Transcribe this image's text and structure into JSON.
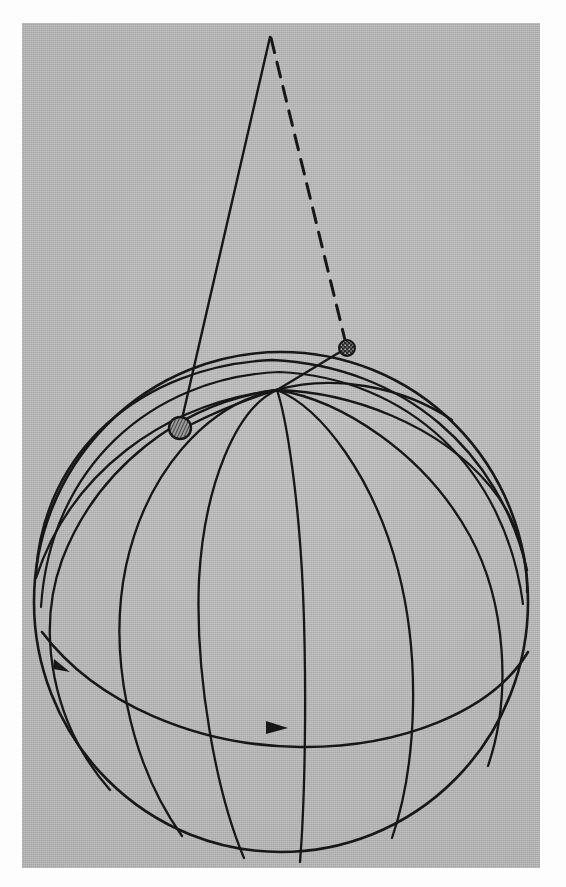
{
  "figure": {
    "title": "Spherical triangle construction on a globe",
    "background_color": "#b8b8b8",
    "page_color": "#fdfdfd",
    "ink_color": "#171717",
    "plate": {
      "x": 22,
      "y": 23,
      "width": 518,
      "height": 845
    }
  },
  "diagram": {
    "type": "line-drawing",
    "sphere": {
      "center_x": 281,
      "center_y": 602,
      "radius_x": 247,
      "radius_y": 250,
      "outline_label": "sphere-outline"
    },
    "pole": {
      "label": "pole-convergence-point",
      "x": 277,
      "y": 390
    },
    "apex": {
      "label": "apex-vertex",
      "x": 270,
      "y": 37
    },
    "markers": [
      {
        "name": "hatched-disc-marker",
        "x": 180,
        "y": 428,
        "radius": 11,
        "fill": "hatched",
        "stroke": "#171717"
      },
      {
        "name": "blob-marker",
        "x": 347,
        "y": 348,
        "radius": 8,
        "fill": "mottled",
        "stroke": "#171717"
      }
    ],
    "edges": [
      {
        "name": "solid-edge-apex-to-hatched-disc",
        "style": "solid",
        "from": "apex",
        "to": "hatched-disc-marker"
      },
      {
        "name": "dashed-edge-apex-to-blob",
        "style": "dashed",
        "from": "apex",
        "to": "blob-marker"
      }
    ],
    "arrows": [
      {
        "name": "equator-arrow-left",
        "x": 60,
        "y": 665,
        "direction": "down-right"
      },
      {
        "name": "equator-arrow-right",
        "x": 278,
        "y": 727,
        "direction": "right"
      }
    ],
    "meridian_count": 6,
    "latitude_count": 2,
    "grid": "meridians-and-equator",
    "legend": [],
    "annotations": []
  }
}
